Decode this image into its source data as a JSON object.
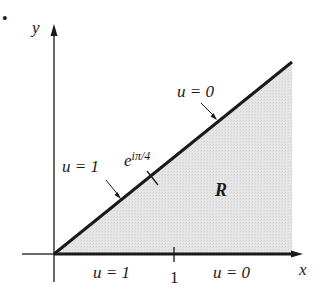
{
  "figure": {
    "bullet": "•",
    "axes": {
      "x_label": "x",
      "y_label": "y",
      "tick_label": "1"
    },
    "region_label": "R",
    "point_label_base": "e",
    "point_label_exp": "iπ/4",
    "boundary_labels": {
      "diagonal_upper": "u = 0",
      "diagonal_lower": "u = 1",
      "xaxis_left": "u = 1",
      "xaxis_right": "u = 0"
    },
    "colors": {
      "ink": "#1a1a1a",
      "shade": "#e4e4e4"
    }
  }
}
